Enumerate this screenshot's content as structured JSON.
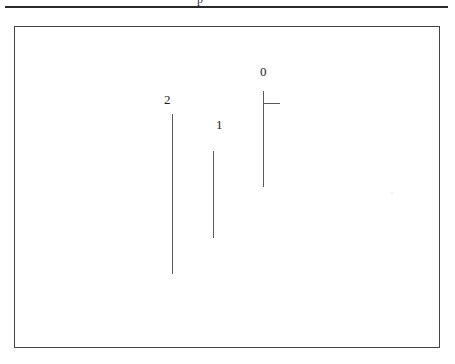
{
  "page": {
    "background_color": "#ffffff",
    "width": 455,
    "height": 364
  },
  "top_rule": {
    "name": "page-separator-rule",
    "color": "#2a2a2a",
    "clipped_glyph_text": "p"
  },
  "figure": {
    "frame": {
      "border_color": "#444444",
      "background_color": "#ffffff",
      "x": 14,
      "y": 26,
      "width": 426,
      "height": 322
    },
    "caption": "",
    "line_color": "#5a5a5a",
    "label_color": "#1d1d1d"
  },
  "chart_data": {
    "type": "diagram",
    "title": "",
    "subtitle": "",
    "xlabel": "",
    "ylabel": "",
    "grid": false,
    "legend": "none",
    "units": "px",
    "xlim": [
      14,
      440
    ],
    "ylim": [
      26,
      348
    ],
    "branches": [
      {
        "label": "2",
        "label_x": 163,
        "label_y": 92,
        "stem_x": 171,
        "stem_top": 113,
        "stem_bottom": 273,
        "stem_length": 160,
        "ticks": []
      },
      {
        "label": "1",
        "label_x": 215,
        "label_y": 117,
        "stem_x": 212,
        "stem_top": 150,
        "stem_bottom": 237,
        "stem_length": 87,
        "ticks": []
      },
      {
        "label": "0",
        "label_x": 259,
        "label_y": 64,
        "stem_x": 262,
        "stem_top": 90,
        "stem_bottom": 186,
        "stem_length": 96,
        "ticks": [
          {
            "y": 102,
            "x_start": 263,
            "x_end": 279,
            "length": 16,
            "direction": "right"
          }
        ]
      }
    ]
  }
}
